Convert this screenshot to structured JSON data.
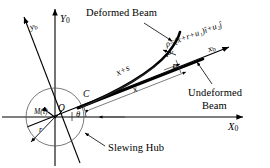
{
  "figure": {
    "background_color": "#ffffff",
    "line_color": "#000000",
    "thin_line_color": "#3a3a3a"
  },
  "axes": {
    "inertial": {
      "x_label": "X",
      "x_sub": "0",
      "y_label": "Y",
      "y_sub": "0"
    },
    "body": {
      "x_label": "x",
      "x_sub": "b",
      "y_label": "y",
      "y_sub": "b"
    }
  },
  "labels": {
    "deformed_beam": "Deformed Beam",
    "undeformed_beam_line1": "Undeformed",
    "undeformed_beam_line2": "Beam",
    "slewing_hub": "Slewing Hub",
    "hub_torque": "M(t)",
    "hub_radius": "r",
    "hub_angle": "θ",
    "origin_point": "O",
    "clamp_point": "C",
    "point_p": "P",
    "point_p_prime": "P′",
    "arc_length": "x+s",
    "axial_coord": "x"
  },
  "equation": {
    "rho": "ρ",
    "equals": "=",
    "body": "(x+r+u₁)î+u₂ĵ",
    "full": "ρ = (x+r+u₁)î + u₂ĵ"
  },
  "geometry": {
    "hub_center_x": 55,
    "hub_center_y": 117,
    "hub_radius_px": 29,
    "theta_degrees": 22
  }
}
